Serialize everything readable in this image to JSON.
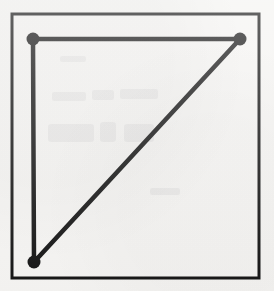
{
  "figure": {
    "title": "Right triangle with three marked vertices inside a rectangular frame",
    "caption": "",
    "background_color": "#f5f4f2",
    "ink_color": "#141414",
    "canvas": {
      "width": 274,
      "height": 291
    },
    "frame": {
      "label": "outer rectangular border",
      "x": 12,
      "y": 14,
      "width": 247,
      "height": 264,
      "stroke_width": 3,
      "stroke_color": "#141414",
      "fill": "none"
    },
    "shape": {
      "label": "right triangle",
      "type": "polyline",
      "closed": false,
      "stroke_width": 4.5,
      "stroke_color": "#141414",
      "fill": "none",
      "description": "Vertical leg on the left, horizontal leg along the top, hypotenuse from bottom-left up to top-right",
      "edges": [
        {
          "label": "top leg",
          "from": "top-left",
          "to": "top-right",
          "orientation": "horizontal"
        },
        {
          "label": "hypotenuse",
          "from": "top-right",
          "to": "bottom-left",
          "orientation": "diagonal"
        },
        {
          "label": "left leg",
          "from": "bottom-left",
          "to": "top-left",
          "orientation": "vertical"
        }
      ]
    },
    "vertices": [
      {
        "id": "top-left",
        "label": "top-left vertex",
        "x": 33,
        "y": 39,
        "marker": "filled-circle",
        "radius": 6.5
      },
      {
        "id": "top-right",
        "label": "top-right vertex",
        "x": 240,
        "y": 39,
        "marker": "filled-circle",
        "radius": 6.5
      },
      {
        "id": "bottom-left",
        "label": "bottom-left vertex",
        "x": 34,
        "y": 262,
        "marker": "filled-circle",
        "radius": 6.5
      }
    ],
    "unmarked_corners": [
      {
        "id": "bottom-right",
        "label": "bottom-right corner (no marker)",
        "x": 240,
        "y": 262
      }
    ],
    "artifacts": {
      "label": "faint show-through ghosting from reverse of scanned page",
      "visible": true,
      "opacity": 0.05,
      "region": {
        "x": 40,
        "y": 85,
        "width": 125,
        "height": 75
      }
    }
  }
}
